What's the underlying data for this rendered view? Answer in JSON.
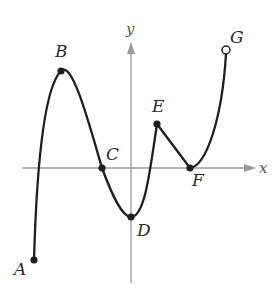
{
  "figure": {
    "axes": {
      "x_label": "x",
      "y_label": "y",
      "color": "#9a9a9a"
    },
    "curve_color": "#1e1e1e",
    "points": [
      {
        "label": "A",
        "x": 34,
        "y": 260,
        "open": false,
        "lx": 14,
        "ly": 275
      },
      {
        "label": "B",
        "x": 61,
        "y": 71,
        "open": false,
        "lx": 55,
        "ly": 57
      },
      {
        "label": "C",
        "x": 102,
        "y": 168,
        "open": false,
        "lx": 106,
        "ly": 160
      },
      {
        "label": "D",
        "x": 131,
        "y": 217,
        "open": false,
        "lx": 137,
        "ly": 236
      },
      {
        "label": "E",
        "x": 157,
        "y": 124,
        "open": false,
        "lx": 152,
        "ly": 112
      },
      {
        "label": "F",
        "x": 190,
        "y": 168,
        "open": false,
        "lx": 192,
        "ly": 186
      },
      {
        "label": "G",
        "x": 226,
        "y": 50,
        "open": true,
        "lx": 230,
        "ly": 43
      }
    ]
  }
}
